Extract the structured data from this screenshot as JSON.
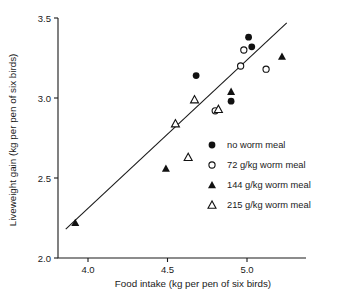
{
  "chart_data": {
    "type": "scatter",
    "title": "",
    "xlabel": "Food intake (kg per pen of six birds)",
    "ylabel": "Liveweight gain (kg per pen of six birds)",
    "xlim": [
      3.86,
      5.3
    ],
    "ylim": [
      2.0,
      3.5
    ],
    "xticks": [
      "4.0",
      "4.5",
      "5.0"
    ],
    "xtick_values": [
      4.0,
      4.5,
      5.0
    ],
    "yticks": [
      "2.0",
      "2.5",
      "3.0",
      "3.5"
    ],
    "ytick_values": [
      2.0,
      2.5,
      3.0,
      3.5
    ],
    "grid": false,
    "legend_position": "center-right",
    "series": [
      {
        "name": "no worm meal",
        "marker": "filled-circle",
        "color": "#111111",
        "points": [
          {
            "x": 4.68,
            "y": 3.14
          },
          {
            "x": 4.9,
            "y": 2.98
          },
          {
            "x": 5.01,
            "y": 3.38
          },
          {
            "x": 5.03,
            "y": 3.32
          }
        ]
      },
      {
        "name": "72 g/kg worm meal",
        "marker": "open-circle",
        "color": "#111111",
        "points": [
          {
            "x": 4.8,
            "y": 2.92
          },
          {
            "x": 4.96,
            "y": 3.2
          },
          {
            "x": 4.98,
            "y": 3.3
          },
          {
            "x": 5.12,
            "y": 3.18
          }
        ]
      },
      {
        "name": "144 g/kg worm meal",
        "marker": "filled-triangle",
        "color": "#111111",
        "points": [
          {
            "x": 3.92,
            "y": 2.22
          },
          {
            "x": 4.49,
            "y": 2.56
          },
          {
            "x": 4.9,
            "y": 3.04
          },
          {
            "x": 5.22,
            "y": 3.26
          }
        ]
      },
      {
        "name": "215 g/kg worm meal",
        "marker": "open-triangle",
        "color": "#111111",
        "points": [
          {
            "x": 4.55,
            "y": 2.84
          },
          {
            "x": 4.63,
            "y": 2.63
          },
          {
            "x": 4.67,
            "y": 2.99
          },
          {
            "x": 4.82,
            "y": 2.93
          }
        ]
      }
    ],
    "fit_line": {
      "name": "regression line",
      "x_start": 3.86,
      "y_start": 2.18,
      "x_end": 5.25,
      "y_end": 3.47
    }
  }
}
